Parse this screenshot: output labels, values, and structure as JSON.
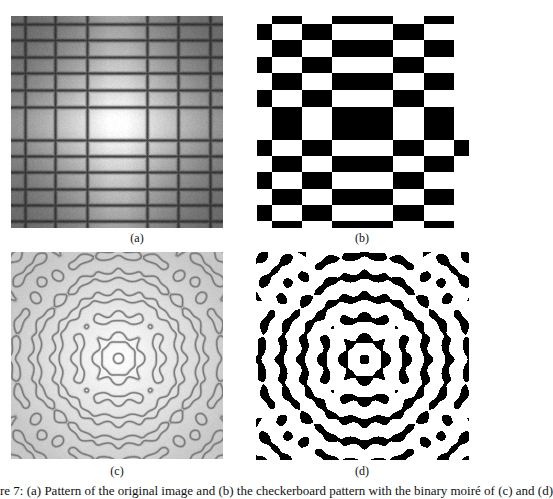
{
  "figure": {
    "panels": [
      {
        "id": "a",
        "label": "(a)",
        "type": "grayscale-grid-beats",
        "box": {
          "x": 11,
          "y": 16,
          "w": 212,
          "h": 212
        },
        "label_pos": {
          "x": 117,
          "y": 231
        },
        "vertical_lines_x": [
          14,
          44,
          76,
          136,
          167,
          199
        ],
        "horizontal_lines_y": [
          8,
          24,
          41,
          57,
          74,
          91,
          124,
          140,
          156,
          173,
          189,
          205
        ],
        "bright_band_x": [
          76,
          136
        ],
        "bright_band_y": [
          91,
          124
        ],
        "line_color": "#2a2a2a",
        "corner_tone": "#6a6a6a",
        "center_tone": "#ffffff"
      },
      {
        "id": "b",
        "label": "(b)",
        "type": "binary-checkerboard",
        "box": {
          "x": 257,
          "y": 16,
          "w": 212,
          "h": 212
        },
        "label_pos": {
          "x": 342,
          "y": 231
        },
        "col_edges_x": [
          257,
          272,
          302,
          332,
          393,
          424,
          454,
          469
        ],
        "row_edges_y": [
          16,
          24,
          40,
          57,
          73,
          90,
          107,
          140,
          156,
          172,
          189,
          205,
          221,
          228
        ],
        "last_column_black_rows": [
          7
        ],
        "black": "#000000",
        "white": "#ffffff"
      },
      {
        "id": "c",
        "label": "(c)",
        "type": "contour-moire",
        "box": {
          "x": 11,
          "y": 252,
          "w": 212,
          "h": 207
        },
        "center": {
          "x": 107,
          "y": 106
        },
        "label_pos": {
          "x": 97,
          "y": 464
        },
        "k": 0.3,
        "threshold": 0.6,
        "line_color": "#707070",
        "bg_edge": "#c8c8c8",
        "bg_center": "#ffffff"
      },
      {
        "id": "d",
        "label": "(d)",
        "type": "binary-moire",
        "box": {
          "x": 256,
          "y": 252,
          "w": 213,
          "h": 208
        },
        "center": {
          "x": 108,
          "y": 107
        },
        "label_pos": {
          "x": 342,
          "y": 464
        },
        "k": 0.3,
        "threshold": 0.6,
        "black": "#000000",
        "white": "#ffffff"
      }
    ],
    "caption": "re 7: (a) Pattern of the original image and (b) the checkerboard pattern with the binary moiré of (c) and (d)"
  }
}
